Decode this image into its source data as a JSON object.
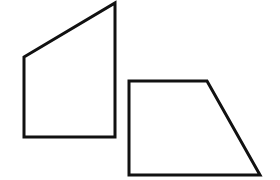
{
  "diagram": {
    "background": "#ffffff",
    "stroke_color": "#111111",
    "stroke_width": 3,
    "shapes": [
      {
        "name": "left-quadrilateral",
        "type": "polygon",
        "points": "24,57 115,3 115,137 24,137"
      },
      {
        "name": "right-trapezoid",
        "type": "polygon",
        "points": "129,81 207,81 260,175 129,175"
      }
    ]
  }
}
